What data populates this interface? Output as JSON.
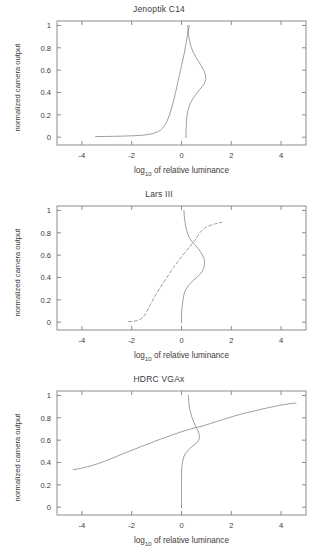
{
  "figure": {
    "width": 318,
    "height": 560,
    "background": "#ffffff",
    "axis_color": "#808080",
    "curve_color": "#8c8c8c",
    "text_color": "#3c3c3c"
  },
  "axes": {
    "xlabel_main": "of relative luminance",
    "xlabel_prefix": "log",
    "xlabel_sub": "10",
    "ylabel": "normalized camera output",
    "xticks": [
      "-4",
      "-2",
      "0",
      "2",
      "4"
    ],
    "xtick_values": [
      -4,
      -2,
      0,
      2,
      4
    ],
    "yticks": [
      "0",
      "0.2",
      "0.4",
      "0.6",
      "0.8",
      "1"
    ],
    "ytick_values": [
      0,
      0.2,
      0.4,
      0.6,
      0.8,
      1
    ],
    "xlim": [
      -5,
      5
    ],
    "ylim": [
      -0.07,
      1.04
    ]
  },
  "chart_data": [
    {
      "type": "line",
      "title": "Jenoptik C14",
      "xlabel": "log10 of relative luminance",
      "ylabel": "normalized camera output",
      "xlim": [
        -5,
        5
      ],
      "ylim": [
        -0.07,
        1.04
      ],
      "grid": false,
      "legend": "none",
      "series": [
        {
          "name": "response curve",
          "style": "solid",
          "points": [
            [
              -3.45,
              0.005
            ],
            [
              -3.1,
              0.006
            ],
            [
              -2.7,
              0.008
            ],
            [
              -2.3,
              0.01
            ],
            [
              -1.9,
              0.013
            ],
            [
              -1.6,
              0.017
            ],
            [
              -1.35,
              0.023
            ],
            [
              -1.15,
              0.032
            ],
            [
              -0.98,
              0.045
            ],
            [
              -0.85,
              0.062
            ],
            [
              -0.74,
              0.085
            ],
            [
              -0.65,
              0.115
            ],
            [
              -0.56,
              0.155
            ],
            [
              -0.48,
              0.2
            ],
            [
              -0.41,
              0.25
            ],
            [
              -0.35,
              0.3
            ],
            [
              -0.29,
              0.35
            ],
            [
              -0.24,
              0.4
            ],
            [
              -0.19,
              0.45
            ],
            [
              -0.14,
              0.5
            ],
            [
              -0.09,
              0.55
            ],
            [
              -0.04,
              0.6
            ],
            [
              0.01,
              0.65
            ],
            [
              0.06,
              0.7
            ],
            [
              0.11,
              0.75
            ],
            [
              0.15,
              0.8
            ],
            [
              0.19,
              0.85
            ],
            [
              0.23,
              0.9
            ],
            [
              0.27,
              0.95
            ],
            [
              0.3,
              0.985
            ],
            [
              0.32,
              1.0
            ]
          ]
        },
        {
          "name": "derivative / sensitivity curve",
          "style": "solid",
          "points": [
            [
              0.18,
              -0.005
            ],
            [
              0.18,
              0.04
            ],
            [
              0.19,
              0.09
            ],
            [
              0.2,
              0.14
            ],
            [
              0.22,
              0.19
            ],
            [
              0.26,
              0.24
            ],
            [
              0.33,
              0.29
            ],
            [
              0.44,
              0.34
            ],
            [
              0.6,
              0.39
            ],
            [
              0.78,
              0.44
            ],
            [
              0.92,
              0.48
            ],
            [
              0.98,
              0.52
            ],
            [
              0.96,
              0.56
            ],
            [
              0.89,
              0.6
            ],
            [
              0.79,
              0.64
            ],
            [
              0.68,
              0.68
            ],
            [
              0.57,
              0.72
            ],
            [
              0.47,
              0.76
            ],
            [
              0.4,
              0.8
            ],
            [
              0.35,
              0.84
            ],
            [
              0.31,
              0.88
            ],
            [
              0.28,
              0.92
            ],
            [
              0.26,
              0.96
            ],
            [
              0.25,
              1.0
            ]
          ]
        }
      ]
    },
    {
      "type": "line",
      "title": "Lars III",
      "xlabel": "log10 of relative luminance",
      "ylabel": "normalized camera output",
      "xlim": [
        -5,
        5
      ],
      "ylim": [
        -0.07,
        1.04
      ],
      "grid": false,
      "legend": "none",
      "series": [
        {
          "name": "response curve",
          "style": "dashed",
          "points": [
            [
              -2.12,
              0.005
            ],
            [
              -1.95,
              0.007
            ],
            [
              -1.78,
              0.014
            ],
            [
              -1.64,
              0.028
            ],
            [
              -1.53,
              0.048
            ],
            [
              -1.45,
              0.072
            ],
            [
              -1.38,
              0.1
            ],
            [
              -1.31,
              0.13
            ],
            [
              -1.24,
              0.16
            ],
            [
              -1.17,
              0.19
            ],
            [
              -1.1,
              0.22
            ],
            [
              -1.02,
              0.25
            ],
            [
              -0.94,
              0.28
            ],
            [
              -0.86,
              0.31
            ],
            [
              -0.77,
              0.34
            ],
            [
              -0.68,
              0.37
            ],
            [
              -0.59,
              0.4
            ],
            [
              -0.5,
              0.43
            ],
            [
              -0.41,
              0.46
            ],
            [
              -0.32,
              0.49
            ],
            [
              -0.22,
              0.52
            ],
            [
              -0.12,
              0.55
            ],
            [
              -0.02,
              0.58
            ],
            [
              0.09,
              0.61
            ],
            [
              0.2,
              0.64
            ],
            [
              0.31,
              0.67
            ],
            [
              0.42,
              0.7
            ],
            [
              0.52,
              0.725
            ],
            [
              0.6,
              0.75
            ],
            [
              0.66,
              0.775
            ],
            [
              0.73,
              0.8
            ],
            [
              0.84,
              0.825
            ],
            [
              0.97,
              0.848
            ],
            [
              1.1,
              0.862
            ],
            [
              1.24,
              0.872
            ],
            [
              1.38,
              0.882
            ],
            [
              1.52,
              0.89
            ],
            [
              1.62,
              0.895
            ]
          ]
        },
        {
          "name": "derivative / sensitivity curve",
          "style": "solid",
          "points": [
            [
              0.0,
              -0.005
            ],
            [
              0.0,
              0.05
            ],
            [
              0.01,
              0.1
            ],
            [
              0.03,
              0.15
            ],
            [
              0.06,
              0.2
            ],
            [
              0.1,
              0.25
            ],
            [
              0.17,
              0.29
            ],
            [
              0.28,
              0.33
            ],
            [
              0.45,
              0.37
            ],
            [
              0.66,
              0.41
            ],
            [
              0.82,
              0.45
            ],
            [
              0.9,
              0.49
            ],
            [
              0.93,
              0.53
            ],
            [
              0.9,
              0.57
            ],
            [
              0.82,
              0.61
            ],
            [
              0.7,
              0.65
            ],
            [
              0.56,
              0.69
            ],
            [
              0.42,
              0.72
            ],
            [
              0.32,
              0.755
            ],
            [
              0.25,
              0.79
            ],
            [
              0.2,
              0.83
            ],
            [
              0.16,
              0.87
            ],
            [
              0.13,
              0.91
            ],
            [
              0.11,
              0.95
            ],
            [
              0.1,
              1.0
            ]
          ]
        }
      ]
    },
    {
      "type": "line",
      "title": "HDRC VGAx",
      "xlabel": "log10 of relative luminance",
      "ylabel": "normalized camera output",
      "xlim": [
        -5,
        5
      ],
      "ylim": [
        -0.07,
        1.04
      ],
      "grid": false,
      "legend": "none",
      "series": [
        {
          "name": "response curve",
          "style": "solid",
          "points": [
            [
              -4.35,
              0.335
            ],
            [
              -4.1,
              0.345
            ],
            [
              -3.85,
              0.358
            ],
            [
              -3.6,
              0.372
            ],
            [
              -3.35,
              0.39
            ],
            [
              -3.1,
              0.41
            ],
            [
              -2.85,
              0.432
            ],
            [
              -2.6,
              0.455
            ],
            [
              -2.35,
              0.478
            ],
            [
              -2.1,
              0.5
            ],
            [
              -1.85,
              0.522
            ],
            [
              -1.6,
              0.545
            ],
            [
              -1.35,
              0.565
            ],
            [
              -1.1,
              0.588
            ],
            [
              -0.85,
              0.608
            ],
            [
              -0.6,
              0.628
            ],
            [
              -0.35,
              0.648
            ],
            [
              -0.1,
              0.668
            ],
            [
              0.15,
              0.686
            ],
            [
              0.4,
              0.702
            ],
            [
              0.65,
              0.716
            ],
            [
              0.9,
              0.73
            ],
            [
              1.15,
              0.748
            ],
            [
              1.4,
              0.766
            ],
            [
              1.65,
              0.784
            ],
            [
              1.9,
              0.8
            ],
            [
              2.15,
              0.818
            ],
            [
              2.4,
              0.834
            ],
            [
              2.65,
              0.848
            ],
            [
              2.9,
              0.86
            ],
            [
              3.15,
              0.874
            ],
            [
              3.4,
              0.886
            ],
            [
              3.65,
              0.898
            ],
            [
              3.9,
              0.91
            ],
            [
              4.15,
              0.92
            ],
            [
              4.4,
              0.928
            ],
            [
              4.6,
              0.932
            ]
          ]
        },
        {
          "name": "derivative / sensitivity curve",
          "style": "solid",
          "points": [
            [
              0.0,
              -0.005
            ],
            [
              0.0,
              0.06
            ],
            [
              0.0,
              0.12
            ],
            [
              0.0,
              0.18
            ],
            [
              0.0,
              0.24
            ],
            [
              0.005,
              0.3
            ],
            [
              0.015,
              0.355
            ],
            [
              0.04,
              0.405
            ],
            [
              0.09,
              0.45
            ],
            [
              0.19,
              0.49
            ],
            [
              0.33,
              0.525
            ],
            [
              0.5,
              0.555
            ],
            [
              0.63,
              0.58
            ],
            [
              0.7,
              0.605
            ],
            [
              0.72,
              0.63
            ],
            [
              0.7,
              0.66
            ],
            [
              0.64,
              0.695
            ],
            [
              0.56,
              0.73
            ],
            [
              0.48,
              0.77
            ],
            [
              0.41,
              0.81
            ],
            [
              0.36,
              0.85
            ],
            [
              0.32,
              0.89
            ],
            [
              0.3,
              0.93
            ],
            [
              0.285,
              0.97
            ],
            [
              0.28,
              1.0
            ]
          ]
        }
      ]
    }
  ]
}
